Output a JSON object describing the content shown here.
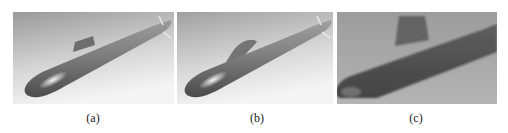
{
  "figure": {
    "panels": [
      {
        "id": "a",
        "caption": "(a)",
        "subject": "submarine-3d-model-render",
        "style": "smooth shaded CAD render, light gradient background"
      },
      {
        "id": "b",
        "caption": "(b)",
        "subject": "submarine-3d-model-render-variant",
        "style": "smooth shaded render with faired sail"
      },
      {
        "id": "c",
        "caption": "(c)",
        "subject": "submarine-physical-model-photo",
        "style": "grainy close-up photograph, dark hull"
      }
    ],
    "colors": {
      "background": "#ffffff",
      "caption_text": "#222222",
      "render_bg_top": "#9a9a9a",
      "render_bg_bottom": "#f2f2f2",
      "hull_light": "#d8d8d8",
      "hull_mid": "#8a8a8a",
      "hull_dark": "#4a4a4a",
      "photo_bg": "#a8a8a8",
      "photo_hull": "#5a5a5a"
    }
  }
}
